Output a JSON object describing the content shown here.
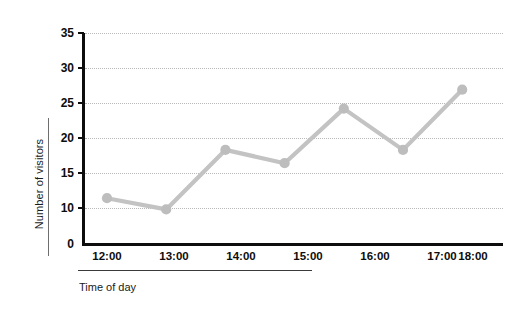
{
  "chart_data": {
    "type": "line",
    "title": "",
    "subtitle": "",
    "xlabel": "Time of day",
    "ylabel": "Number of visitors",
    "categories": [
      "12:00",
      "13:00",
      "14:00",
      "15:00",
      "16:00",
      "17:00",
      "18:00"
    ],
    "values": [
      11.4,
      9.8,
      18.3,
      16.4,
      24.2,
      18.3,
      26.9
    ],
    "series": [
      {
        "name": "Number of visitors",
        "values": [
          11.4,
          9.8,
          18.3,
          16.4,
          24.2,
          18.3,
          26.9
        ]
      }
    ],
    "ytick_labels": [
      "0",
      "10",
      "15",
      "20",
      "25",
      "30",
      "35"
    ],
    "ytick_values": [
      0,
      10,
      15,
      20,
      25,
      30,
      35
    ],
    "ylim": [
      0,
      35
    ],
    "xlim_categories": [
      "12:00",
      "18:00"
    ],
    "grid": true,
    "grid_axis": "y",
    "grid_style": "dotted",
    "legend": false,
    "legend_position": "none",
    "broken_axis": true,
    "broken_axis_note": "y-axis compressed between 0 and 10; no tick at 5",
    "marker": "circle",
    "line_color": "#c3c3c3",
    "marker_color": "#bdbdbd",
    "axis_color": "#0d0d0d",
    "grid_color": "#b9b9b9",
    "background_color": "#ffffff"
  },
  "axes": {
    "y_title": "Number of visitors",
    "x_title": "Time of day",
    "y_ticks": [
      {
        "label": "35",
        "value": 35
      },
      {
        "label": "30",
        "value": 30
      },
      {
        "label": "25",
        "value": 25
      },
      {
        "label": "20",
        "value": 20
      },
      {
        "label": "15",
        "value": 15
      },
      {
        "label": "10",
        "value": 10
      },
      {
        "label": "0",
        "value": 0
      }
    ],
    "x_ticks": [
      {
        "label": "12:00"
      },
      {
        "label": "13:00"
      },
      {
        "label": "14:00"
      },
      {
        "label": "15:00"
      },
      {
        "label": "16:00"
      },
      {
        "label": "17:00"
      },
      {
        "label": "18:00"
      }
    ]
  }
}
